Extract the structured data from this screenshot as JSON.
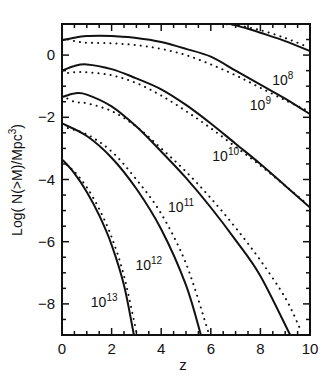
{
  "chart_data": {
    "type": "line",
    "title": "",
    "xlabel": "z",
    "ylabel": "Log( N(>M)/Mpc³)",
    "xlim": [
      0,
      10
    ],
    "ylim": [
      -9,
      1
    ],
    "xticks": [
      0,
      2,
      4,
      6,
      8,
      10
    ],
    "yticks": [
      0,
      -2,
      -4,
      -6,
      -8
    ],
    "grid": false,
    "legend": "inline curve labels",
    "series": [
      {
        "name": "10^8",
        "label_base": "10",
        "label_exp": "8",
        "style": "solid",
        "x": [
          6.8,
          7.5,
          8,
          9,
          10
        ],
        "y": [
          1.0,
          0.85,
          0.72,
          0.45,
          0.13
        ]
      },
      {
        "name": "10^9",
        "label_base": "10",
        "label_exp": "9",
        "style": "solid",
        "x": [
          0,
          0.5,
          1,
          1.5,
          2,
          3,
          4,
          5,
          6,
          7,
          8,
          9,
          10
        ],
        "y": [
          0.48,
          0.56,
          0.61,
          0.62,
          0.61,
          0.55,
          0.42,
          0.2,
          -0.05,
          -0.5,
          -0.95,
          -1.4,
          -1.9
        ]
      },
      {
        "name": "10^10",
        "label_base": "10",
        "label_exp": "10",
        "style": "solid",
        "x": [
          0,
          0.5,
          1,
          2,
          3,
          4,
          5,
          6,
          7,
          8,
          9,
          10
        ],
        "y": [
          -0.5,
          -0.35,
          -0.3,
          -0.45,
          -0.75,
          -1.1,
          -1.6,
          -2.2,
          -2.85,
          -3.5,
          -4.2,
          -4.9
        ]
      },
      {
        "name": "10^11",
        "label_base": "10",
        "label_exp": "11",
        "style": "solid",
        "x": [
          0,
          0.5,
          1,
          2,
          3,
          4,
          5,
          6,
          7,
          8,
          9.2
        ],
        "y": [
          -1.35,
          -1.23,
          -1.27,
          -1.65,
          -2.3,
          -3.1,
          -3.95,
          -4.9,
          -5.95,
          -7.1,
          -9.0
        ]
      },
      {
        "name": "10^12",
        "label_base": "10",
        "label_exp": "12",
        "style": "solid",
        "x": [
          0,
          1,
          2,
          3,
          4,
          5,
          5.6
        ],
        "y": [
          -2.2,
          -2.6,
          -3.3,
          -4.3,
          -5.6,
          -7.4,
          -9.0
        ]
      },
      {
        "name": "10^13",
        "label_base": "10",
        "label_exp": "13",
        "style": "solid",
        "x": [
          0,
          0.5,
          1,
          1.5,
          2,
          2.5,
          2.9
        ],
        "y": [
          -3.35,
          -3.8,
          -4.4,
          -5.15,
          -6.1,
          -7.4,
          -9.0
        ]
      }
    ],
    "dotted_series_note": "each solid curve is accompanied by a dotted comparison curve slightly offset to the right/above",
    "dotted_series": [
      {
        "name": "10^8 dotted",
        "x": [
          6.4,
          7,
          8,
          9,
          9.8
        ],
        "y": [
          1.0,
          0.97,
          0.8,
          0.55,
          0.3
        ]
      },
      {
        "name": "10^9 dotted",
        "x": [
          0,
          0.5,
          1,
          2,
          3,
          4,
          5,
          6,
          7,
          8,
          9,
          9.8
        ],
        "y": [
          0.55,
          0.45,
          0.4,
          0.38,
          0.32,
          0.2,
          0.0,
          -0.3,
          -0.65,
          -1.05,
          -1.45,
          -1.75
        ]
      },
      {
        "name": "10^10 dotted",
        "x": [
          0,
          0.5,
          1,
          2,
          3,
          4,
          5,
          6,
          7,
          8,
          9,
          9.9
        ],
        "y": [
          -0.6,
          -0.55,
          -0.55,
          -0.65,
          -0.9,
          -1.3,
          -1.8,
          -2.35,
          -2.95,
          -3.55,
          -4.2,
          -4.8
        ]
      },
      {
        "name": "10^11 dotted",
        "x": [
          0,
          0.5,
          1,
          2,
          3,
          4,
          5,
          6,
          7,
          8,
          9,
          9.6
        ],
        "y": [
          -1.3,
          -1.5,
          -1.55,
          -1.8,
          -2.3,
          -3.0,
          -3.75,
          -4.6,
          -5.55,
          -6.6,
          -7.8,
          -8.8
        ]
      },
      {
        "name": "10^12 dotted",
        "x": [
          0,
          1,
          2,
          3,
          4,
          5,
          5.9
        ],
        "y": [
          -2.3,
          -2.55,
          -3.1,
          -4.0,
          -5.1,
          -6.7,
          -8.9
        ]
      },
      {
        "name": "10^13 dotted",
        "x": [
          0,
          0.5,
          1,
          1.5,
          2,
          2.5,
          3.0
        ],
        "y": [
          -3.4,
          -3.75,
          -4.25,
          -4.95,
          -5.85,
          -7.1,
          -8.9
        ]
      }
    ],
    "annotations": [
      {
        "text": "10^8",
        "x": 8.9,
        "y": -0.95
      },
      {
        "text": "10^9",
        "x": 8.0,
        "y": -1.75
      },
      {
        "text": "10^10",
        "x": 6.6,
        "y": -3.4
      },
      {
        "text": "10^11",
        "x": 4.8,
        "y": -5.05
      },
      {
        "text": "10^12",
        "x": 3.5,
        "y": -6.9
      },
      {
        "text": "10^13",
        "x": 1.7,
        "y": -8.1
      }
    ]
  },
  "axes": {
    "xlabel": "z",
    "ylabel_prefix": "Log( N(>M)/Mpc",
    "ylabel_sup": "3",
    "ylabel_suffix": ")",
    "xtick_labels": [
      "0",
      "2",
      "4",
      "6",
      "8",
      "10"
    ],
    "ytick_labels": [
      "0",
      "−2",
      "−4",
      "−6",
      "−8"
    ]
  }
}
